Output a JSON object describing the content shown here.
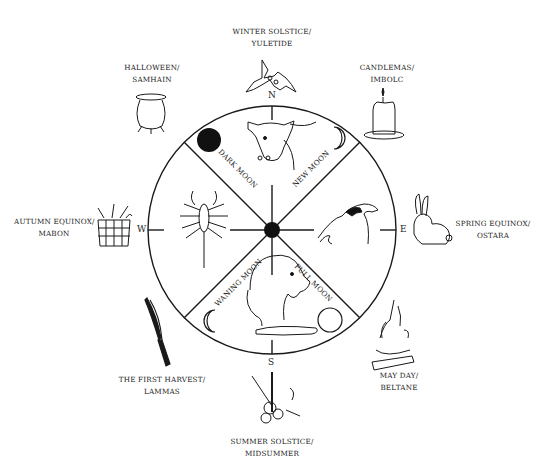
{
  "wheel": {
    "center": [
      272,
      230
    ],
    "radius": 124,
    "stroke_color": "#1a1a1a",
    "directions": {
      "north": "N",
      "south": "S",
      "east": "E",
      "west": "W"
    },
    "moon_phases": [
      {
        "label": "DARK MOON",
        "symbol": "filled-circle"
      },
      {
        "label": "NEW MOON",
        "symbol": "crescent"
      },
      {
        "label": "FULL MOON",
        "symbol": "empty-circle"
      },
      {
        "label": "WANING MOON",
        "symbol": "crescent"
      }
    ],
    "animals": [
      {
        "position": "north",
        "name": "bull"
      },
      {
        "position": "east",
        "name": "eagle"
      },
      {
        "position": "south",
        "name": "lion"
      },
      {
        "position": "west",
        "name": "scorpion"
      }
    ]
  },
  "festivals": [
    {
      "id": "winter",
      "line1": "WINTER SOLSTICE/",
      "line2": "YULETIDE",
      "icon": "holly"
    },
    {
      "id": "candlemas",
      "line1": "CANDLEMAS/",
      "line2": "IMBOLC",
      "icon": "candle"
    },
    {
      "id": "spring",
      "line1": "SPRING EQUINOX/",
      "line2": "OSTARA",
      "icon": "rabbit"
    },
    {
      "id": "mayday",
      "line1": "MAY DAY/",
      "line2": "BELTANE",
      "icon": "bonfire"
    },
    {
      "id": "summer",
      "line1": "SUMMER SOLSTICE/",
      "line2": "MIDSUMMER",
      "icon": "flowers-wheat"
    },
    {
      "id": "lammas",
      "line1": "THE FIRST HARVEST/",
      "line2": "LAMMAS",
      "icon": "wheat-sheaf"
    },
    {
      "id": "autumn",
      "line1": "AUTUMN EQUINOX/",
      "line2": "MABON",
      "icon": "harvest-basket"
    },
    {
      "id": "halloween",
      "line1": "HALLOWEEN/",
      "line2": "SAMHAIN",
      "icon": "cauldron"
    }
  ]
}
